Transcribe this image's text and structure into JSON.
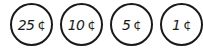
{
  "coins": [
    {
      "value": "25",
      "unit": "¢"
    },
    {
      "value": "10",
      "unit": "¢"
    },
    {
      "value": "5",
      "unit": "¢"
    },
    {
      "value": "1",
      "unit": "¢"
    }
  ]
}
